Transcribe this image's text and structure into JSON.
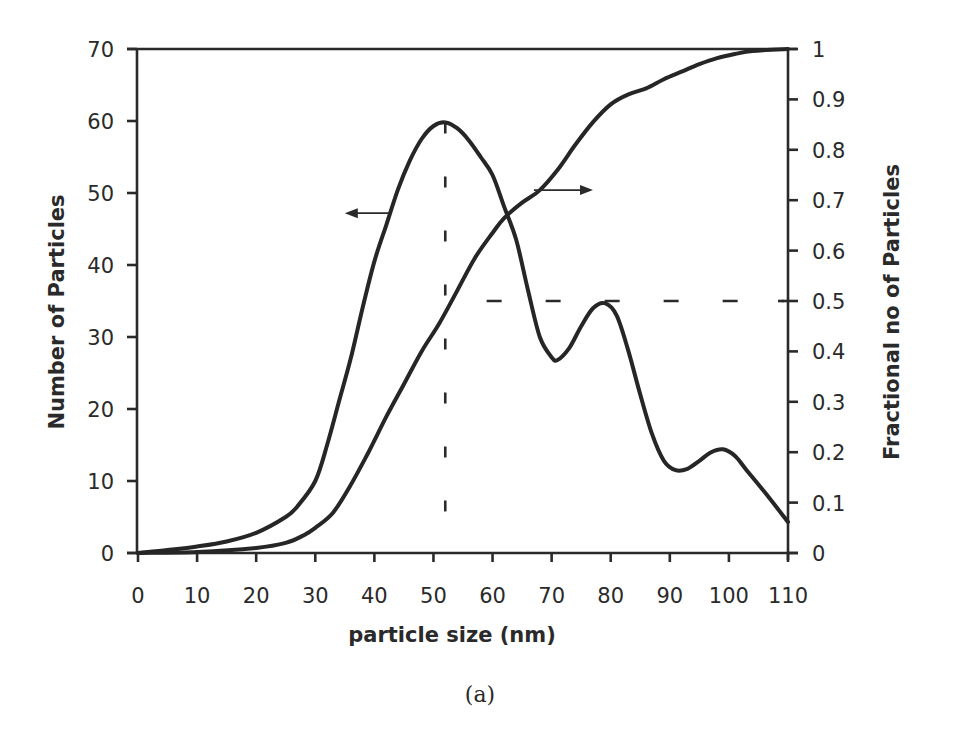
{
  "figure": {
    "caption": "(a)"
  },
  "chart_data": {
    "type": "line",
    "title": "",
    "xlabel": "particle size (nm)",
    "ylabel": "Number of Particles",
    "ylabel_right": "Fractional no of Particles",
    "xlim": [
      0,
      110
    ],
    "ylim": [
      0,
      70
    ],
    "ylim_right": [
      0,
      1
    ],
    "x_ticks": [
      "0",
      "10",
      "20",
      "30",
      "40",
      "50",
      "60",
      "70",
      "80",
      "90",
      "100",
      "110"
    ],
    "y_ticks": [
      "0",
      "10",
      "20",
      "30",
      "40",
      "50",
      "60",
      "70"
    ],
    "y_ticks_right": [
      "0",
      "0.1",
      "0.2",
      "0.3",
      "0.4",
      "0.5",
      "0.6",
      "0.7",
      "0.8",
      "0.9",
      "1"
    ],
    "grid": false,
    "legend": "none (arrows indicate axis for each curve)",
    "series": [
      {
        "name": "Number of Particles",
        "axis": "left",
        "x": [
          0,
          5,
          10,
          15,
          20,
          25,
          27,
          30,
          32,
          34,
          36,
          38,
          40,
          42,
          44,
          46,
          48,
          50,
          52,
          54,
          56,
          58,
          60,
          62,
          64,
          66,
          68,
          70,
          71,
          73,
          75,
          77,
          79,
          81,
          83,
          85,
          87,
          89,
          91,
          93,
          95,
          97,
          99,
          101,
          103,
          106,
          110
        ],
        "values": [
          0,
          0.4,
          0.9,
          1.6,
          2.8,
          5,
          6.5,
          10,
          15,
          21,
          27,
          34,
          40.5,
          45.5,
          50.5,
          54.5,
          57.5,
          59.3,
          59.8,
          59,
          57.3,
          55,
          52.5,
          48,
          43.5,
          36.5,
          30,
          27.2,
          26.8,
          28.5,
          31.5,
          34,
          34.7,
          33,
          28,
          22,
          16.5,
          12.8,
          11.5,
          11.7,
          12.8,
          14,
          14.4,
          13.5,
          11.5,
          8.5,
          4.3
        ]
      },
      {
        "name": "Fractional no of Particles",
        "axis": "right",
        "x": [
          0,
          10,
          20,
          25,
          28,
          30,
          33,
          36,
          39,
          42,
          45,
          48,
          51,
          54,
          57,
          60,
          62,
          65,
          68,
          71,
          74,
          77,
          80,
          83,
          86,
          89,
          92,
          95,
          98,
          101,
          104,
          110
        ],
        "values": [
          0,
          0.002,
          0.01,
          0.02,
          0.035,
          0.05,
          0.08,
          0.135,
          0.2,
          0.27,
          0.335,
          0.4,
          0.456,
          0.52,
          0.585,
          0.635,
          0.665,
          0.695,
          0.72,
          0.76,
          0.81,
          0.855,
          0.89,
          0.91,
          0.922,
          0.94,
          0.955,
          0.97,
          0.982,
          0.99,
          0.996,
          1.0
        ]
      }
    ],
    "annotations": [
      {
        "type": "vertical-dashed-line",
        "x": 52,
        "y_from": 5.5,
        "y_to": 59.8,
        "note": "mode of number distribution"
      },
      {
        "type": "horizontal-dashed-line",
        "y_right": 0.5,
        "x_from": 59,
        "x_to": 110,
        "note": "median (fraction = 0.5)"
      },
      {
        "type": "arrow",
        "direction": "left",
        "from_x": 42.5,
        "to_x": 35,
        "y": 47.2,
        "note": "points to left axis (number curve)"
      },
      {
        "type": "arrow",
        "direction": "right",
        "from_x": 67,
        "to_x": 77,
        "y_right": 0.72,
        "note": "points to right axis (fractional curve)"
      }
    ]
  }
}
